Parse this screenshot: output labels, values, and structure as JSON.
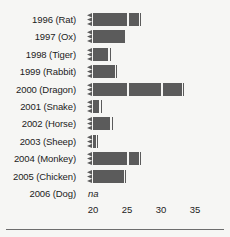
{
  "chart_data": {
    "type": "bar",
    "orientation": "horizontal",
    "title": "",
    "subtitle": "",
    "xlabel": "",
    "ylabel": "",
    "xlim": [
      20,
      35
    ],
    "axis_break": true,
    "axis_break_note": "bars begin with a zigzag break marker; value axis starts at 20",
    "grid": false,
    "legend": null,
    "xticks": [
      20,
      25,
      30,
      35
    ],
    "xtick_labels": [
      "20",
      "25",
      "30",
      "35"
    ],
    "categories": [
      "1996 (Rat)",
      "1997 (Ox)",
      "1998 (Tiger)",
      "1999 (Rabbit)",
      "2000 (Dragon)",
      "2001 (Snake)",
      "2002 (Horse)",
      "2003 (Sheep)",
      "2004 (Monkey)",
      "2005 (Chicken)",
      "2006 (Dog)"
    ],
    "values": [
      27.1,
      25.1,
      22.6,
      23.6,
      33.4,
      21.3,
      22.9,
      20.8,
      27.1,
      24.9,
      null
    ],
    "value_labels": [
      "",
      "",
      "",
      "",
      "",
      "",
      "",
      "",
      "",
      "",
      "na"
    ],
    "missing_label": "na",
    "bar_color": "#5b5b5b",
    "background_color": "#f6f6f4",
    "text_color": "#1c1c1c",
    "rule_color": "#6d6d6d",
    "series": [
      {
        "name": "value",
        "values": [
          27.1,
          25.1,
          22.6,
          23.6,
          33.4,
          21.3,
          22.9,
          20.8,
          27.1,
          24.9,
          null
        ]
      }
    ]
  },
  "figure": {
    "bottom_rule_present": true
  }
}
